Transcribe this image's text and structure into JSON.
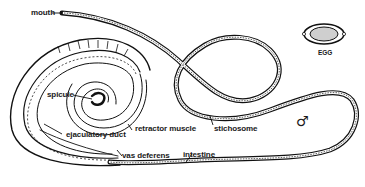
{
  "figure": {
    "labels": {
      "mouth": "mouth",
      "egg": "EGG",
      "spicule": "spicule",
      "retractor_muscle": "retractor muscle",
      "stichosome": "stichosome",
      "ejaculatory_duct": "ejaculatory duct",
      "vas_deferens": "vas deferens",
      "intestine": "intestine",
      "male_symbol": "♂"
    }
  },
  "colors": {
    "ink": "#111111",
    "background": "#ffffff",
    "egg_fill": "#cfcfcf"
  }
}
